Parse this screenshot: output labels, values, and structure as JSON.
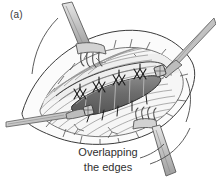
{
  "figure": {
    "panel_label": "(a)",
    "caption_line1": "Overlapping",
    "caption_line2": "the edges",
    "title": "Overlapping the edges",
    "type": "surgical-illustration",
    "style": "grayscale line drawing with halftone shading"
  },
  "colors": {
    "background": "#ffffff",
    "outline": "#2b2b2b",
    "line_light": "#8d8d8d",
    "tissue_fill": "#f2f2f2",
    "fascia_fill": "#e8e8e8",
    "fat_fill": "#fafafa",
    "overlap_dark": "#6a6a6a",
    "overlap_dark_edge": "#3c3c3c",
    "instrument_fill": "#d6d6d6",
    "instrument_shade": "#a9a9a9",
    "instrument_outline": "#5b5b5b",
    "suture": "#1f1f1f",
    "text": "#2f2f2f"
  },
  "scene": {
    "description": "Open surgical field showing a lens-shaped incision with fascial edges overlapped in the midline and secured with mattress sutures; two rake retractors hold the wound open and two forceps grasp the fascial edges.",
    "elements": [
      {
        "name": "wound-field",
        "label": "Lens-shaped open wound field",
        "count": 1
      },
      {
        "name": "fat-border",
        "label": "Subcutaneous fat lobules at wound margin",
        "count": 1
      },
      {
        "name": "fascia-striations",
        "label": "Striated fascia / muscle fibers",
        "count": 1
      },
      {
        "name": "overlap-flap",
        "label": "Overlapped fascial edge (dark shaded)",
        "count": 1
      },
      {
        "name": "mattress-suture",
        "label": "Mattress suture",
        "count": 4
      },
      {
        "name": "overlap-stitch",
        "label": "Stitch across overlapped edge",
        "count": 5
      },
      {
        "name": "rake-retractor",
        "label": "Rake retractor",
        "count": 2
      },
      {
        "name": "forceps",
        "label": "Tissue forceps",
        "count": 2
      },
      {
        "name": "traction-arc",
        "label": "Traction direction arc",
        "count": 3
      },
      {
        "name": "caption-leader",
        "label": "Caption leader line",
        "count": 1
      }
    ]
  }
}
